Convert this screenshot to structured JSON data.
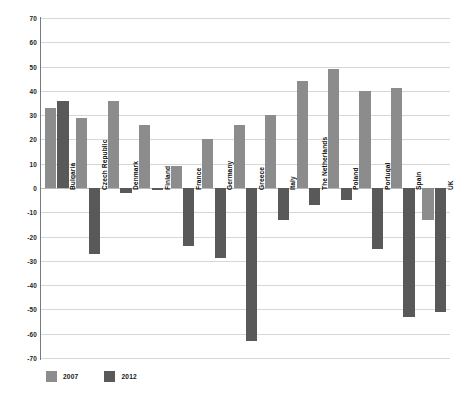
{
  "chart_data": {
    "type": "bar",
    "title": "",
    "subtitle": "",
    "xlabel": "",
    "ylabel": "",
    "ylim": [
      -70,
      70
    ],
    "ytick_step": 10,
    "yticks": [
      70,
      60,
      50,
      40,
      30,
      20,
      10,
      0,
      -10,
      -20,
      -30,
      -40,
      -50,
      -60,
      -70
    ],
    "grid": true,
    "legend_position": "bottom-left",
    "categories": [
      "Bulgaria",
      "Czech Republic",
      "Denmark",
      "Finland",
      "France",
      "Germany",
      "Greece",
      "Italy",
      "The Netherlands",
      "Poland",
      "Portugal",
      "Spain",
      "UK"
    ],
    "series": [
      {
        "name": "2007",
        "color": "#8c8c8c",
        "values": [
          33,
          29,
          36,
          26,
          9,
          20,
          26,
          30,
          44,
          49,
          40,
          41,
          -13
        ]
      },
      {
        "name": "2012",
        "color": "#595959",
        "values": [
          36,
          -27,
          -2,
          -1,
          -24,
          -29,
          -63,
          -13,
          -7,
          -5,
          -25,
          -53,
          -51
        ]
      }
    ]
  },
  "legend": {
    "items": [
      {
        "label": "2007",
        "color": "#8c8c8c"
      },
      {
        "label": "2012",
        "color": "#595959"
      }
    ]
  },
  "axis": {
    "zero_value": 0
  }
}
